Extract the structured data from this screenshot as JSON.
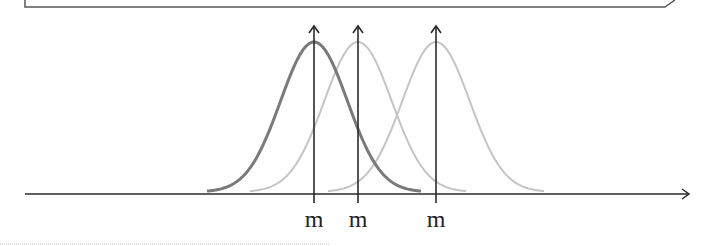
{
  "diagram": {
    "title": "",
    "colors": {
      "axis": "#2a2a2a",
      "curve_primary": "#7a7a7a",
      "curve_secondary": "#c4c4c4",
      "box": "#555555",
      "dotted_rule": "#bbbbbb"
    },
    "axis": {
      "x_start": 25,
      "x_end": 690,
      "y": 194
    },
    "curves": [
      {
        "name": "curve-1",
        "mean_x": 314,
        "left_x": 207,
        "right_x": 421,
        "peak_y": 42,
        "style": "dark",
        "label": "m"
      },
      {
        "name": "curve-2",
        "mean_x": 358,
        "left_x": 250,
        "right_x": 466,
        "peak_y": 42,
        "style": "light",
        "label": "m"
      },
      {
        "name": "curve-3",
        "mean_x": 436,
        "left_x": 328,
        "right_x": 544,
        "peak_y": 42,
        "style": "light",
        "label": "m"
      }
    ],
    "labels": [
      "m",
      "m",
      "m"
    ]
  }
}
